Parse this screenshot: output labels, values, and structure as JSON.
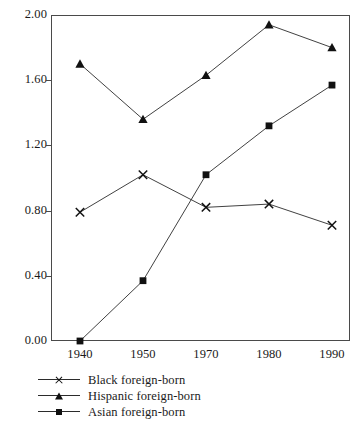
{
  "chart_data": {
    "type": "line",
    "title": "",
    "subtitle": "",
    "xlabel": "",
    "ylabel": "",
    "categories": [
      "1940",
      "1950",
      "1970",
      "1980",
      "1990"
    ],
    "x": [
      1940,
      1950,
      1970,
      1980,
      1990
    ],
    "ylim": [
      0.0,
      2.0
    ],
    "yticks": [
      "0.00",
      "0.40",
      "0.80",
      "1.20",
      "1.60",
      "2.00"
    ],
    "ytick_values": [
      0.0,
      0.4,
      0.8,
      1.2,
      1.6,
      2.0
    ],
    "grid": false,
    "legend_position": "below-left",
    "series": [
      {
        "name": "Black foreign-born",
        "marker": "cross",
        "color": "#111111",
        "values": [
          0.79,
          1.02,
          0.82,
          0.84,
          0.71
        ]
      },
      {
        "name": "Hispanic foreign-born",
        "marker": "triangle",
        "color": "#111111",
        "values": [
          1.7,
          1.36,
          1.63,
          1.94,
          1.8
        ]
      },
      {
        "name": "Asian foreign-born",
        "marker": "square",
        "color": "#111111",
        "values": [
          0.0,
          0.37,
          1.02,
          1.32,
          1.57
        ]
      }
    ],
    "annotations": []
  },
  "legend": {
    "items": [
      {
        "label": "Black foreign-born",
        "marker": "cross"
      },
      {
        "label": "Hispanic foreign-born",
        "marker": "triangle"
      },
      {
        "label": "Asian foreign-born",
        "marker": "square"
      }
    ]
  },
  "axes": {
    "frame_color": "#4a4a4a",
    "line_color": "#2b2b2b"
  }
}
